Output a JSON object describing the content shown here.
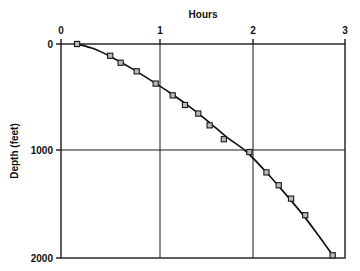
{
  "chart_data": {
    "type": "line",
    "title": "",
    "xlabel": "Hours",
    "ylabel": "Depth (feet)",
    "xlim": [
      0,
      3
    ],
    "ylim": [
      2000,
      0
    ],
    "y_inverted": true,
    "x_axis_position": "top",
    "grid": true,
    "grid_x_values": [
      1,
      2
    ],
    "grid_y_values": [
      1000
    ],
    "xticks": [
      0,
      1,
      2,
      3
    ],
    "xtick_labels": [
      "0",
      "1",
      "2",
      "3"
    ],
    "yticks": [
      0,
      1000,
      2000
    ],
    "ytick_labels": [
      "0",
      "1000",
      "2000"
    ],
    "legend": null,
    "series": [
      {
        "name": "Depth vs Hours",
        "marker": "square",
        "line_style": "solid",
        "x": [
          0.17,
          0.52,
          0.63,
          0.8,
          1.0,
          1.18,
          1.31,
          1.45,
          1.57,
          1.72,
          1.99,
          2.17,
          2.3,
          2.43,
          2.58,
          2.87
        ],
        "y": [
          0,
          110,
          175,
          255,
          370,
          480,
          570,
          650,
          760,
          890,
          1010,
          1200,
          1320,
          1445,
          1600,
          1975
        ]
      }
    ],
    "curve_points": [
      [
        0.17,
        0
      ],
      [
        0.35,
        45
      ],
      [
        0.55,
        130
      ],
      [
        0.75,
        230
      ],
      [
        0.95,
        340
      ],
      [
        1.15,
        455
      ],
      [
        1.35,
        580
      ],
      [
        1.55,
        720
      ],
      [
        1.75,
        870
      ],
      [
        1.95,
        1000
      ],
      [
        2.15,
        1180
      ],
      [
        2.35,
        1380
      ],
      [
        2.55,
        1590
      ],
      [
        2.72,
        1790
      ],
      [
        2.87,
        1975
      ]
    ]
  }
}
